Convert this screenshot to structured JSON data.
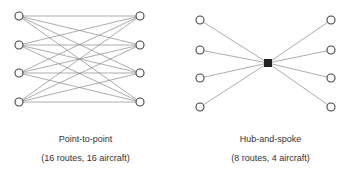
{
  "diagrams": [
    {
      "title": "Point-to-point",
      "caption": "(16 routes, 16 aircraft)"
    },
    {
      "title": "Hub-and-spoke",
      "caption": "(8 routes, 4 aircraft)"
    }
  ],
  "colors": {
    "line": "#888888",
    "node": "#444444",
    "hub": "#222222"
  }
}
